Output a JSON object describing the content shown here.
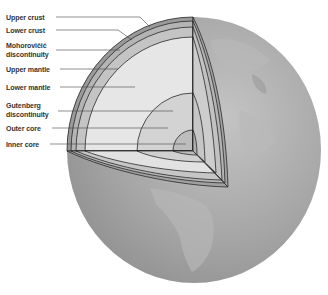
{
  "labels": {
    "upper_crust": "Upper crust",
    "lower_crust": "Lower crust",
    "moho_line1": "Mohorovičić",
    "moho_line2": "discontinuity",
    "upper_mantle": "Upper mantle",
    "lower_mantle": "Lower mantle",
    "gutenberg_line1": "Gutenberg",
    "gutenberg_line2": "discontinuity",
    "outer_core": "Outer core",
    "inner_core": "Inner core"
  },
  "colors": {
    "background": "#ffffff",
    "globe": "#a9a9a9",
    "globe_dark": "#8a8a8a",
    "continents": "#b9b9b9",
    "crust": "#9a9a9a",
    "lower_crust": "#b4b4b4",
    "upper_mantle": "#cfcfcf",
    "lower_mantle": "#e6e6e6",
    "outer_core": "#d3d3d3",
    "inner_core": "#bdbdbd",
    "lines": "#2a2a2a",
    "label_text": "#333333"
  }
}
